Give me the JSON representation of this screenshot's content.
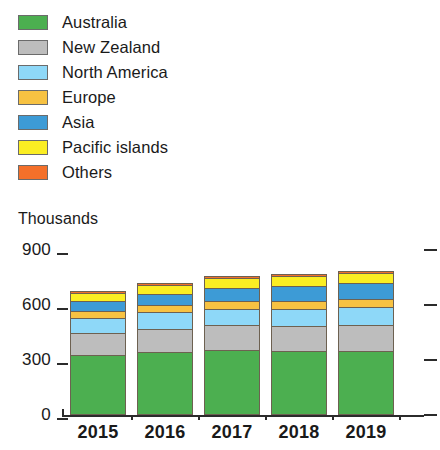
{
  "chart_data": {
    "type": "bar",
    "subtype": "stacked-vertical",
    "title": "",
    "subtitle": "",
    "units_caption": "Thousands",
    "xlabel": "",
    "ylabel": "",
    "categories": [
      "2015",
      "2016",
      "2017",
      "2018",
      "2019"
    ],
    "ylim": [
      0,
      900
    ],
    "yticks": [
      0,
      300,
      600,
      900
    ],
    "ytick_labels": [
      "0",
      "300",
      "600",
      "900"
    ],
    "grid": false,
    "legend_position": "top-left",
    "series": [
      {
        "name": "Australia",
        "color": "#4CAF50",
        "values": [
          330,
          345,
          355,
          350,
          350
        ]
      },
      {
        "name": "New Zealand",
        "color": "#BDBDBD",
        "values": [
          115,
          125,
          135,
          135,
          140
        ]
      },
      {
        "name": "North America",
        "color": "#8ED8F8",
        "values": [
          85,
          90,
          90,
          95,
          100
        ]
      },
      {
        "name": "Europe",
        "color": "#F7C242",
        "values": [
          40,
          40,
          40,
          40,
          45
        ]
      },
      {
        "name": "Asia",
        "color": "#3D9BD6",
        "values": [
          50,
          60,
          75,
          85,
          85
        ]
      },
      {
        "name": "Pacific islands",
        "color": "#FBEE23",
        "values": [
          45,
          50,
          55,
          55,
          55
        ]
      },
      {
        "name": "Others",
        "color": "#F4702A",
        "values": [
          10,
          10,
          10,
          10,
          10
        ]
      }
    ],
    "totals": [
      675,
      720,
      760,
      770,
      785
    ]
  }
}
